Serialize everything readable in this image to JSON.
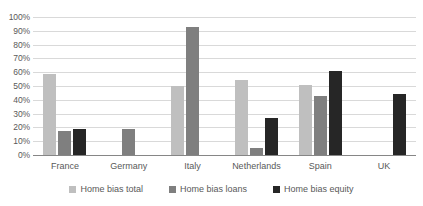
{
  "chart_data": {
    "type": "bar",
    "title": "",
    "subtitle": "",
    "xlabel": "",
    "ylabel": "",
    "ylim": [
      0,
      100
    ],
    "y_unit": "%",
    "grid": true,
    "legend_position": "bottom",
    "categories": [
      "France",
      "Germany",
      "Italy",
      "Netherlands",
      "Spain",
      "UK"
    ],
    "y_ticks": [
      "0%",
      "10%",
      "20%",
      "30%",
      "40%",
      "50%",
      "60%",
      "70%",
      "80%",
      "90%",
      "100%"
    ],
    "y_tick_values": [
      0,
      10,
      20,
      30,
      40,
      50,
      60,
      70,
      80,
      90,
      100
    ],
    "series": [
      {
        "name": "Home bias total",
        "color": "#bfbfbf",
        "values": [
          59,
          null,
          50,
          54,
          51,
          null
        ]
      },
      {
        "name": "Home bias loans",
        "color": "#7f7f7f",
        "values": [
          17.5,
          19,
          93,
          5,
          43,
          null
        ]
      },
      {
        "name": "Home bias equity",
        "color": "#262626",
        "values": [
          18.5,
          null,
          null,
          26.5,
          61,
          44
        ]
      }
    ]
  },
  "colors": {
    "total": "#bfbfbf",
    "loans": "#7f7f7f",
    "equity": "#262626",
    "gridline": "#d9d9d9",
    "axis": "#868686",
    "text": "#595959",
    "background": "#ffffff"
  },
  "legend": {
    "items": [
      {
        "label": "Home bias total",
        "key": "total"
      },
      {
        "label": "Home bias loans",
        "key": "loans"
      },
      {
        "label": "Home bias equity",
        "key": "equity"
      }
    ]
  }
}
